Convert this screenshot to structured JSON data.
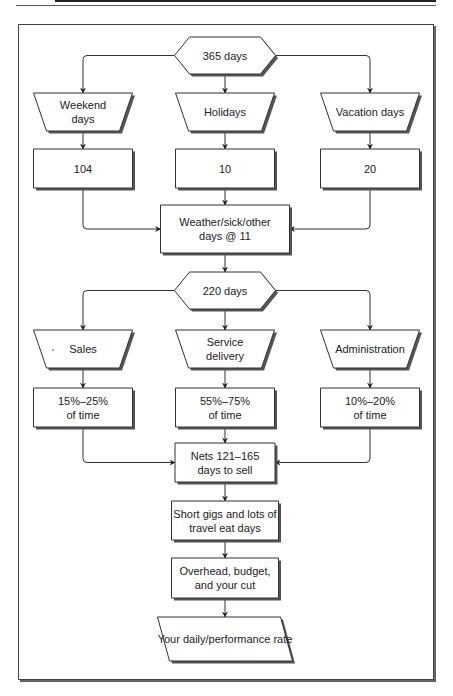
{
  "header": {
    "bar_text": ""
  },
  "flowchart": {
    "nodes": {
      "total_days": {
        "lines": [
          "365 days"
        ],
        "shape": "hexagon"
      },
      "weekend_days": {
        "lines": [
          "Weekend",
          "days"
        ],
        "shape": "trapezoid"
      },
      "holidays": {
        "lines": [
          "Holidays"
        ],
        "shape": "trapezoid"
      },
      "vacation_days": {
        "lines": [
          "Vacation days"
        ],
        "shape": "trapezoid"
      },
      "weekend_count": {
        "lines": [
          "104"
        ],
        "shape": "box"
      },
      "holiday_count": {
        "lines": [
          "10"
        ],
        "shape": "box"
      },
      "vacation_count": {
        "lines": [
          "20"
        ],
        "shape": "box"
      },
      "weather_sick": {
        "lines": [
          "Weather/sick/other",
          "days @ 11"
        ],
        "shape": "box"
      },
      "working_days": {
        "lines": [
          "220 days"
        ],
        "shape": "hexagon"
      },
      "sales": {
        "lines": [
          "Sales"
        ],
        "shape": "trapezoid"
      },
      "service_delivery": {
        "lines": [
          "Service",
          "delivery"
        ],
        "shape": "trapezoid"
      },
      "administration": {
        "lines": [
          "Administration"
        ],
        "shape": "trapezoid"
      },
      "sales_pct": {
        "lines": [
          "15%–25%",
          "of time"
        ],
        "shape": "box"
      },
      "service_pct": {
        "lines": [
          "55%–75%",
          "of time"
        ],
        "shape": "box"
      },
      "admin_pct": {
        "lines": [
          "10%–20%",
          "of time"
        ],
        "shape": "box"
      },
      "nets_days": {
        "lines": [
          "Nets 121–165",
          "days to sell"
        ],
        "shape": "box"
      },
      "short_gigs": {
        "lines": [
          "Short gigs and lots of",
          "travel eat days"
        ],
        "shape": "box"
      },
      "overhead": {
        "lines": [
          "Overhead, budget,",
          "and your cut"
        ],
        "shape": "box"
      },
      "daily_rate": {
        "lines": [
          "Your daily/performance rate"
        ],
        "shape": "parallelogram"
      }
    },
    "edges": [
      [
        "total_days",
        "weekend_days"
      ],
      [
        "total_days",
        "holidays"
      ],
      [
        "total_days",
        "vacation_days"
      ],
      [
        "weekend_days",
        "weekend_count"
      ],
      [
        "holidays",
        "holiday_count"
      ],
      [
        "vacation_days",
        "vacation_count"
      ],
      [
        "weekend_count",
        "weather_sick"
      ],
      [
        "holiday_count",
        "weather_sick"
      ],
      [
        "vacation_count",
        "weather_sick"
      ],
      [
        "weather_sick",
        "working_days"
      ],
      [
        "working_days",
        "sales"
      ],
      [
        "working_days",
        "service_delivery"
      ],
      [
        "working_days",
        "administration"
      ],
      [
        "sales",
        "sales_pct"
      ],
      [
        "service_delivery",
        "service_pct"
      ],
      [
        "administration",
        "admin_pct"
      ],
      [
        "sales_pct",
        "nets_days"
      ],
      [
        "service_pct",
        "nets_days"
      ],
      [
        "admin_pct",
        "nets_days"
      ],
      [
        "nets_days",
        "short_gigs"
      ],
      [
        "short_gigs",
        "overhead"
      ],
      [
        "overhead",
        "daily_rate"
      ]
    ]
  }
}
